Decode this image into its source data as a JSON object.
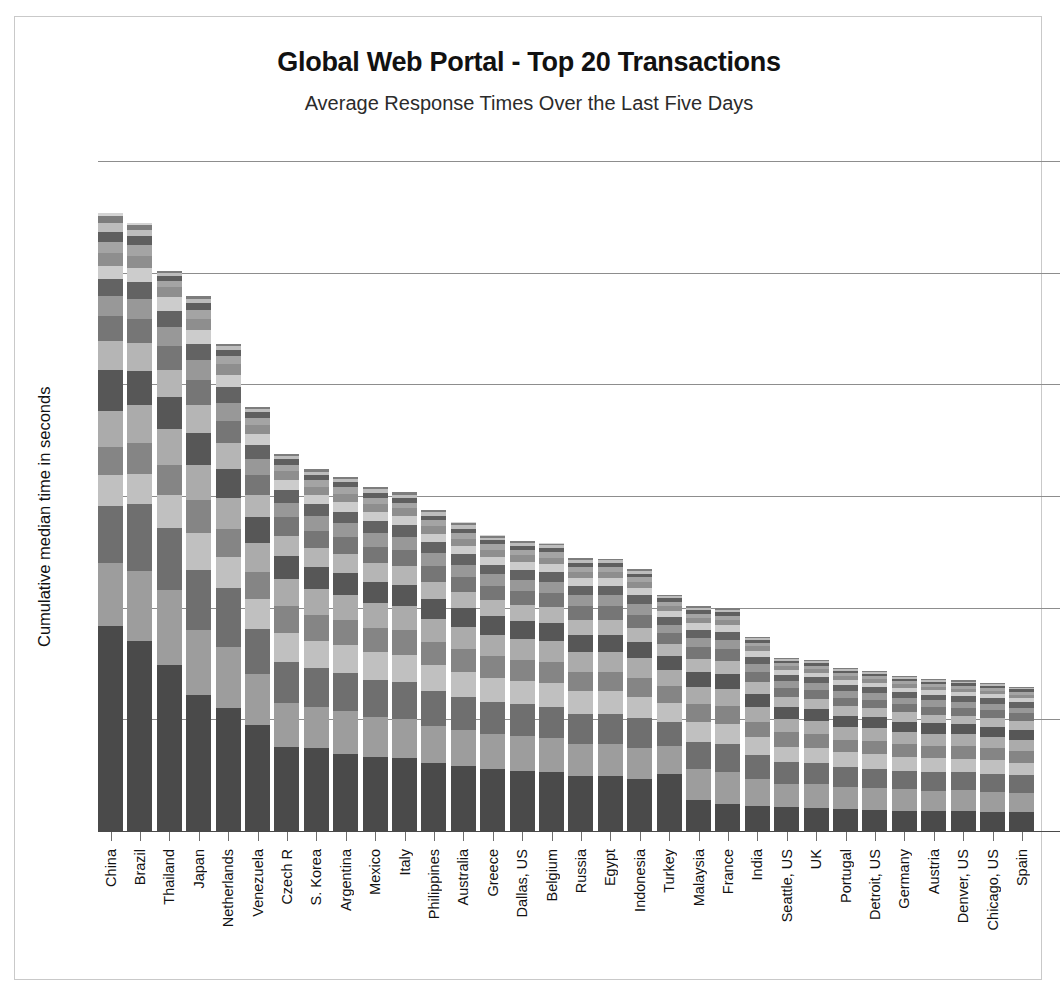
{
  "chart_data": {
    "type": "bar",
    "stacked": true,
    "title": "Global Web Portal - Top 20 Transactions",
    "subtitle": "Average Response Times Over the Last Five Days",
    "xlabel": "",
    "ylabel": "Cumulative median time in seconds",
    "ylim": [
      0,
      120
    ],
    "yticks": [
      0,
      20,
      40,
      60,
      80,
      100,
      120
    ],
    "grid": true,
    "legend": "none",
    "categories": [
      "China",
      "Brazil",
      "Thailand",
      "Japan",
      "Netherlands",
      "Venezuela",
      "Czech R",
      "S. Korea",
      "Argentina",
      "Mexico",
      "Italy",
      "Philippines",
      "Australia",
      "Greece",
      "Dallas, US",
      "Belgium",
      "Russia",
      "Egypt",
      "Indonesia",
      "Turkey",
      "Malaysia",
      "France",
      "India",
      "Seattle, US",
      "UK",
      "Portugal",
      "Detroit, US",
      "Germany",
      "Austria",
      "Denver, US",
      "Chicago, US",
      "Spain"
    ],
    "totals": [
      110.8,
      109.0,
      100.3,
      95.8,
      87.2,
      76.0,
      67.6,
      64.8,
      63.5,
      61.6,
      60.7,
      57.6,
      55.3,
      53.0,
      52.0,
      51.6,
      49.0,
      48.8,
      47.0,
      42.3,
      40.3,
      40.0,
      34.8,
      31.0,
      30.6,
      29.2,
      28.7,
      27.8,
      27.3,
      27.0,
      26.6,
      25.9
    ],
    "palette": [
      "#4a4a4a",
      "#9d9d9d",
      "#6f6f6f",
      "#c0c0c0",
      "#858585",
      "#ababab",
      "#575757",
      "#b5b5b5",
      "#767676",
      "#989898",
      "#636363",
      "#cccccc",
      "#8e8e8e",
      "#a4a4a4",
      "#5f5f5f",
      "#bdbdbd",
      "#7d7d7d",
      "#d4d4d4",
      "#6a6a6a",
      "#b0b0b0"
    ],
    "series_segments": [
      [
        36.8,
        11.2,
        10.2,
        5.5,
        5.0,
        6.6,
        7.2,
        5.2,
        4.6,
        3.5,
        3.0,
        2.5,
        2.2,
        2.0,
        1.8,
        1.6,
        1.2,
        0.7
      ],
      [
        34.4,
        12.6,
        12.2,
        5.4,
        5.6,
        6.8,
        6.2,
        5.0,
        4.4,
        3.6,
        3.0,
        2.6,
        2.2,
        1.9,
        1.6,
        1.2,
        0.8,
        0.5
      ],
      [
        29.8,
        13.4,
        11.0,
        6.0,
        5.4,
        6.4,
        5.8,
        4.8,
        4.2,
        3.4,
        2.9,
        2.5,
        1.8,
        1.2,
        0.9,
        0.5,
        0.3,
        0.0
      ],
      [
        24.4,
        11.6,
        10.8,
        6.5,
        6.0,
        6.2,
        5.8,
        5.0,
        4.4,
        3.6,
        3.0,
        2.4,
        2.0,
        1.6,
        1.2,
        0.8,
        0.5,
        0.0
      ],
      [
        22.0,
        11.0,
        10.5,
        5.6,
        5.0,
        5.6,
        5.2,
        4.6,
        4.0,
        3.2,
        2.8,
        2.2,
        1.9,
        1.5,
        1.1,
        0.7,
        0.3,
        0.0
      ],
      [
        19.0,
        9.2,
        8.0,
        5.4,
        4.8,
        5.2,
        4.6,
        4.0,
        3.6,
        2.9,
        2.4,
        2.0,
        1.6,
        1.3,
        1.0,
        0.6,
        0.4,
        0.0
      ],
      [
        14.8,
        7.6,
        7.2,
        5.2,
        4.6,
        4.8,
        4.0,
        3.6,
        3.2,
        2.6,
        2.2,
        1.8,
        1.5,
        1.2,
        0.9,
        0.6,
        0.4,
        0.0
      ],
      [
        14.4,
        7.2,
        6.8,
        4.8,
        4.4,
        4.6,
        3.8,
        3.4,
        3.0,
        2.5,
        2.1,
        1.7,
        1.4,
        1.1,
        0.9,
        0.6,
        0.4,
        0.0
      ],
      [
        13.5,
        7.4,
        6.6,
        5.0,
        4.2,
        4.4,
        3.8,
        3.4,
        3.0,
        2.4,
        2.0,
        1.7,
        1.4,
        1.1,
        0.9,
        0.6,
        0.4,
        0.0
      ],
      [
        12.8,
        7.0,
        6.4,
        4.8,
        4.2,
        4.4,
        3.6,
        3.2,
        2.9,
        2.4,
        2.0,
        1.6,
        1.4,
        1.1,
        0.8,
        0.6,
        0.4,
        0.0
      ],
      [
        12.6,
        6.8,
        6.4,
        4.7,
        4.2,
        4.3,
        3.6,
        3.2,
        2.8,
        2.3,
        2.0,
        1.6,
        1.3,
        1.0,
        0.8,
        0.6,
        0.4,
        0.0
      ],
      [
        11.8,
        6.4,
        6.0,
        4.5,
        4.0,
        4.0,
        3.4,
        3.0,
        2.7,
        2.2,
        1.9,
        1.5,
        1.3,
        1.0,
        0.8,
        0.6,
        0.4,
        0.1
      ],
      [
        11.4,
        6.2,
        5.8,
        4.4,
        3.9,
        3.9,
        3.3,
        2.9,
        2.6,
        2.1,
        1.8,
        1.5,
        1.2,
        1.0,
        0.8,
        0.6,
        0.4,
        0.1
      ],
      [
        10.8,
        6.0,
        5.6,
        4.2,
        3.7,
        3.7,
        3.2,
        2.8,
        2.5,
        2.0,
        1.7,
        1.4,
        1.2,
        0.9,
        0.7,
        0.5,
        0.3,
        0.1
      ],
      [
        10.4,
        5.9,
        5.5,
        4.1,
        3.6,
        3.6,
        3.1,
        2.7,
        2.4,
        2.0,
        1.7,
        1.4,
        1.1,
        0.9,
        0.7,
        0.5,
        0.3,
        0.1
      ],
      [
        10.2,
        5.8,
        5.4,
        4.1,
        3.6,
        3.6,
        3.1,
        2.7,
        2.4,
        2.0,
        1.7,
        1.4,
        1.1,
        0.9,
        0.7,
        0.5,
        0.3,
        0.1
      ],
      [
        9.4,
        5.5,
        5.2,
        3.9,
        3.4,
        3.4,
        2.9,
        2.6,
        2.3,
        1.9,
        1.6,
        1.3,
        1.1,
        0.9,
        0.7,
        0.5,
        0.3,
        0.1
      ],
      [
        9.4,
        5.5,
        5.2,
        3.9,
        3.4,
        3.4,
        2.9,
        2.6,
        2.3,
        1.9,
        1.6,
        1.3,
        1.1,
        0.8,
        0.7,
        0.5,
        0.3,
        0.0
      ],
      [
        9.0,
        5.3,
        5.0,
        3.7,
        3.3,
        3.3,
        2.8,
        2.5,
        2.2,
        1.8,
        1.5,
        1.3,
        1.0,
        0.8,
        0.6,
        0.5,
        0.3,
        0.1
      ],
      [
        10.2,
        5.0,
        4.4,
        3.4,
        2.9,
        2.9,
        2.5,
        2.2,
        1.9,
        1.6,
        1.4,
        1.1,
        0.9,
        0.7,
        0.6,
        0.4,
        0.2,
        0.0
      ],
      [
        5.2,
        5.4,
        4.6,
        3.4,
        3.0,
        3.0,
        2.5,
        2.2,
        2.0,
        1.6,
        1.4,
        1.1,
        0.9,
        0.7,
        0.6,
        0.4,
        0.3,
        0.0
      ],
      [
        4.6,
        5.4,
        4.8,
        3.4,
        3.0,
        3.0,
        2.5,
        2.2,
        2.0,
        1.6,
        1.4,
        1.1,
        0.9,
        0.7,
        0.6,
        0.4,
        0.4,
        0.0
      ],
      [
        4.2,
        4.6,
        4.0,
        3.0,
        2.6,
        2.6,
        2.2,
        1.9,
        1.7,
        1.4,
        1.2,
        1.0,
        0.8,
        0.6,
        0.5,
        0.3,
        0.2,
        0.0
      ],
      [
        4.0,
        4.0,
        3.6,
        2.7,
        2.4,
        2.3,
        2.0,
        1.7,
        1.5,
        1.2,
        1.0,
        0.8,
        0.7,
        0.5,
        0.4,
        0.3,
        0.2,
        0.0
      ],
      [
        3.9,
        4.0,
        3.5,
        2.6,
        2.3,
        2.3,
        1.9,
        1.7,
        1.5,
        1.2,
        1.0,
        0.8,
        0.7,
        0.5,
        0.4,
        0.3,
        0.2,
        0.0
      ],
      [
        3.7,
        3.8,
        3.4,
        2.5,
        2.2,
        2.2,
        1.9,
        1.6,
        1.4,
        1.2,
        1.0,
        0.8,
        0.7,
        0.5,
        0.4,
        0.3,
        0.2,
        0.0
      ],
      [
        3.6,
        3.7,
        3.3,
        2.5,
        2.2,
        2.2,
        1.8,
        1.6,
        1.4,
        1.1,
        1.0,
        0.8,
        0.6,
        0.5,
        0.4,
        0.3,
        0.2,
        0.0
      ],
      [
        3.5,
        3.6,
        3.2,
        2.4,
        2.1,
        2.1,
        1.8,
        1.6,
        1.4,
        1.1,
        0.9,
        0.8,
        0.6,
        0.5,
        0.4,
        0.3,
        0.2,
        0.0
      ],
      [
        3.4,
        3.5,
        3.2,
        2.4,
        2.1,
        2.1,
        1.8,
        1.5,
        1.4,
        1.1,
        0.9,
        0.8,
        0.6,
        0.5,
        0.4,
        0.3,
        0.2,
        0.0
      ],
      [
        3.4,
        3.5,
        3.1,
        2.3,
        2.1,
        2.0,
        1.7,
        1.5,
        1.3,
        1.1,
        0.9,
        0.7,
        0.6,
        0.5,
        0.4,
        0.3,
        0.2,
        0.0
      ],
      [
        3.3,
        3.4,
        3.1,
        2.3,
        2.0,
        2.0,
        1.7,
        1.5,
        1.3,
        1.1,
        0.9,
        0.7,
        0.6,
        0.5,
        0.4,
        0.3,
        0.2,
        0.0
      ],
      [
        3.2,
        3.3,
        3.0,
        2.2,
        2.0,
        1.9,
        1.7,
        1.5,
        1.3,
        1.0,
        0.9,
        0.7,
        0.6,
        0.5,
        0.4,
        0.3,
        0.2,
        0.0
      ]
    ]
  },
  "frame": {
    "border_color": "#c9c9c9",
    "background": "#ffffff"
  }
}
